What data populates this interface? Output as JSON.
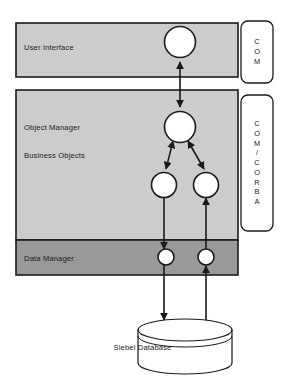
{
  "diagram": {
    "colors": {
      "layer_light": "#cccccc",
      "layer_dark": "#999999",
      "stroke": "#1a1a1a",
      "node_fill": "#ffffff",
      "background": "#ffffff"
    },
    "layers": [
      {
        "id": "user-interface",
        "label": "User Interface",
        "fill": "#cccccc"
      },
      {
        "id": "object-manager",
        "label": "Object Manager",
        "fill": "#cccccc"
      },
      {
        "id": "business-objects",
        "label": "Business Objects",
        "fill": "#cccccc"
      },
      {
        "id": "data-manager",
        "label": "Data Manager",
        "fill": "#999999"
      }
    ],
    "interface_badges": [
      {
        "id": "badge-com",
        "lines": [
          "C",
          "O",
          "M"
        ],
        "text": "COM"
      },
      {
        "id": "badge-com-corba",
        "lines": [
          "C",
          "O",
          "M",
          "/",
          "C",
          "O",
          "R",
          "B",
          "A"
        ],
        "text": "COM / CORBA"
      }
    ],
    "datastore": {
      "id": "siebel-database",
      "label": "Siebel Database",
      "shape": "cylinder"
    },
    "nodes": [
      {
        "id": "ui-object",
        "layer": "user-interface",
        "cx": 180,
        "cy": 42,
        "r": 15.5
      },
      {
        "id": "om-object",
        "layer": "object-manager",
        "cx": 180,
        "cy": 127,
        "r": 15.5
      },
      {
        "id": "bo-object-left",
        "layer": "business-objects",
        "cx": 164,
        "cy": 185,
        "r": 12.5
      },
      {
        "id": "bo-object-right",
        "layer": "business-objects",
        "cx": 206,
        "cy": 185,
        "r": 12.5
      },
      {
        "id": "dm-object-left",
        "layer": "data-manager",
        "cx": 166,
        "cy": 257,
        "r": 8.0
      },
      {
        "id": "dm-object-right",
        "layer": "data-manager",
        "cx": 206,
        "cy": 257,
        "r": 8.0
      }
    ],
    "connections": [
      {
        "id": "ui-to-om",
        "from": "ui-object",
        "to": "om-object",
        "arrows": "both"
      },
      {
        "id": "om-to-bo-left",
        "from": "om-object",
        "to": "bo-object-left",
        "arrows": "both"
      },
      {
        "id": "om-to-bo-right",
        "from": "om-object",
        "to": "bo-object-right",
        "arrows": "both"
      },
      {
        "id": "bo-left-to-dm",
        "from": "bo-object-left",
        "to": "dm-object-left",
        "arrows": "to"
      },
      {
        "id": "dm-to-bo-right",
        "from": "dm-object-right",
        "to": "bo-object-right",
        "arrows": "to"
      },
      {
        "id": "dm-left-to-db",
        "from": "dm-object-left",
        "to": "siebel-database",
        "arrows": "to"
      },
      {
        "id": "db-to-dm-right",
        "from": "siebel-database",
        "to": "dm-object-right",
        "arrows": "to"
      }
    ]
  }
}
